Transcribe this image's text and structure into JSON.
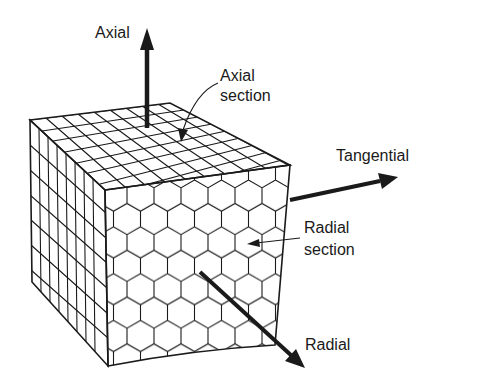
{
  "diagram": {
    "labels": {
      "axial": "Axial",
      "axial_section_line1": "Axial",
      "axial_section_line2": "section",
      "tangential": "Tangential",
      "radial_section_line1": "Radial",
      "radial_section_line2": "section",
      "radial": "Radial"
    },
    "colors": {
      "ink": "#1a1a1a",
      "background": "#ffffff"
    }
  }
}
